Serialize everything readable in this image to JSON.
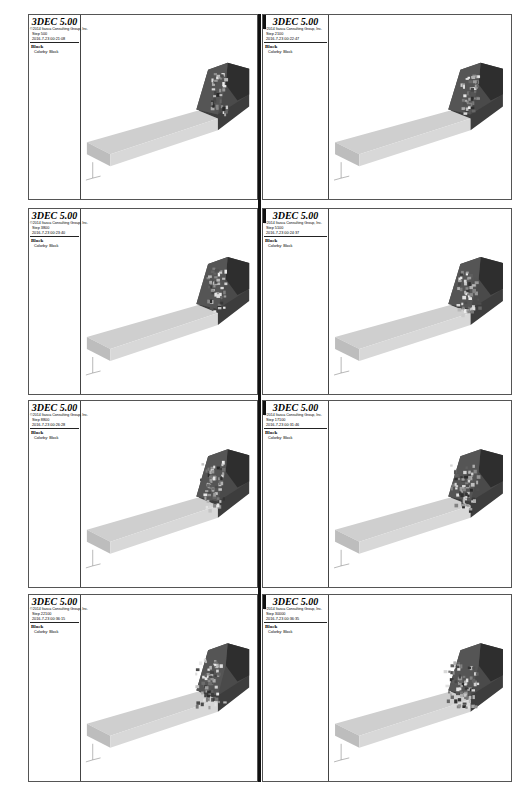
{
  "app": {
    "title": "3DEC 5.00",
    "company": "©2014 Itasca Consulting Group, Inc."
  },
  "plot_label": "Block",
  "color_by": "Colorby: Block",
  "colors": {
    "block_light": "#c9c9c9",
    "block_dark": "#3a3a3a",
    "debris": "#777777"
  },
  "panels": [
    {
      "step": "Step 500",
      "time": "2016-7-23 00:21:08"
    },
    {
      "step": "Step 2100",
      "time": "2016-7-23 00:22:47"
    },
    {
      "step": "Step 3800",
      "time": "2016-7-23 00:23:40"
    },
    {
      "step": "Step 5100",
      "time": "2016-7-23 00:24:37"
    },
    {
      "step": "Step 8800",
      "time": "2016-7-23 00:26:28"
    },
    {
      "step": "Step 17100",
      "time": "2016-7-23 00:31:46"
    },
    {
      "step": "Step 22100",
      "time": "2016-7-23 00:36:15"
    },
    {
      "step": "Step 30000",
      "time": "2016-7-23 00:36:35"
    }
  ]
}
